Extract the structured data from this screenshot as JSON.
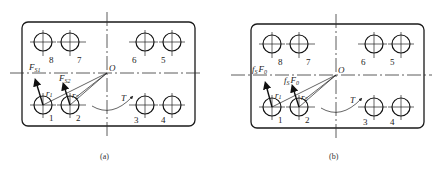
{
  "figure": {
    "panels": [
      {
        "id": "a",
        "caption": "(a)",
        "origin_label": "O",
        "torque_label": "T",
        "hole_labels": [
          "1",
          "2",
          "3",
          "4",
          "5",
          "6",
          "7",
          "8"
        ],
        "radius_labels": [
          {
            "main": "r",
            "sub": "1"
          },
          {
            "main": "r",
            "sub": "2"
          }
        ],
        "force_labels": [
          {
            "main": "F",
            "sub": "S1"
          },
          {
            "main": "F",
            "sub": "S2"
          }
        ]
      },
      {
        "id": "b",
        "caption": "(b)",
        "origin_label": "O",
        "torque_label": "T",
        "hole_labels": [
          "1",
          "2",
          "3",
          "4",
          "5",
          "6",
          "7",
          "8"
        ],
        "radius_labels": [
          {
            "main": "r",
            "sub": "1"
          },
          {
            "main": "r",
            "sub": "2"
          }
        ],
        "force_labels": [
          {
            "main": "f",
            "sub": "S",
            "main2": "F",
            "sub2": "0"
          },
          {
            "main": "f",
            "sub": "S",
            "main2": "F",
            "sub2": "0"
          }
        ]
      }
    ]
  }
}
